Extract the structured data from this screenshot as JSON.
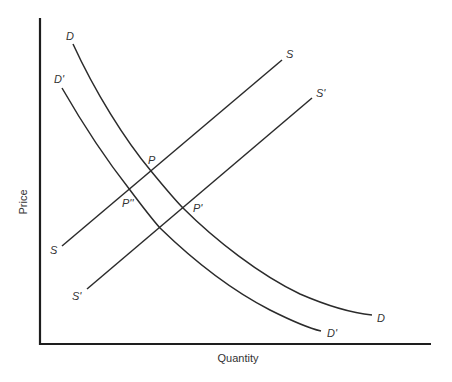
{
  "diagram": {
    "x_axis_label": "Quantity",
    "y_axis_label": "Price",
    "colors": {
      "line": "#2b2b2b",
      "axis": "#1e1e1e",
      "text": "#333333",
      "background": "#ffffff"
    },
    "curves": [
      {
        "id": "D",
        "label": "D",
        "type": "demand",
        "points": [
          [
            73,
            44
          ],
          [
            100,
            100
          ],
          [
            151,
            171
          ],
          [
            183,
            208
          ],
          [
            250,
            255
          ],
          [
            320,
            300
          ],
          [
            372,
            315
          ]
        ]
      },
      {
        "id": "D1",
        "label": "D'",
        "type": "demand",
        "points": [
          [
            62,
            88
          ],
          [
            90,
            135
          ],
          [
            130,
            190
          ],
          [
            160,
            228
          ],
          [
            180,
            245
          ],
          [
            250,
            295
          ],
          [
            321,
            331
          ]
        ]
      },
      {
        "id": "S",
        "label": "S",
        "type": "supply",
        "points": [
          [
            62,
            246
          ],
          [
            282,
            60
          ]
        ]
      },
      {
        "id": "S1",
        "label": "S'",
        "type": "supply",
        "points": [
          [
            87,
            289
          ],
          [
            312,
            98
          ]
        ]
      }
    ],
    "curve_labels": [
      {
        "text": "D",
        "x": 66,
        "y": 40
      },
      {
        "text": "D'",
        "x": 54,
        "y": 83
      },
      {
        "text": "S",
        "x": 286,
        "y": 58
      },
      {
        "text": "S'",
        "x": 316,
        "y": 97
      },
      {
        "text": "S",
        "x": 50,
        "y": 254
      },
      {
        "text": "S'",
        "x": 72,
        "y": 300
      },
      {
        "text": "D",
        "x": 377,
        "y": 322
      },
      {
        "text": "D'",
        "x": 327,
        "y": 337
      }
    ],
    "equilibria": [
      {
        "label": "P",
        "x": 151,
        "y": 171,
        "label_x": 149,
        "label_y": 163
      },
      {
        "label": "P''",
        "x": 130,
        "y": 190,
        "label_x": 122,
        "label_y": 207
      },
      {
        "label": "P'",
        "x": 183,
        "y": 208,
        "label_x": 192,
        "label_y": 212
      }
    ]
  }
}
